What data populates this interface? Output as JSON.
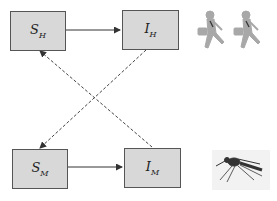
{
  "diagram": {
    "nodes": [
      {
        "id": "SH",
        "label": "S",
        "sub": "H",
        "meaning": "susceptible humans"
      },
      {
        "id": "IH",
        "label": "I",
        "sub": "H",
        "meaning": "infected humans"
      },
      {
        "id": "SM",
        "label": "S",
        "sub": "M",
        "meaning": "susceptible mosquitoes"
      },
      {
        "id": "IM",
        "label": "I",
        "sub": "M",
        "meaning": "infected mosquitoes"
      }
    ],
    "edges": [
      {
        "from": "SH",
        "to": "IH",
        "style": "solid"
      },
      {
        "from": "SM",
        "to": "IM",
        "style": "solid"
      },
      {
        "from": "IH",
        "to": "SM",
        "style": "dashed"
      },
      {
        "from": "IM",
        "to": "SH",
        "style": "dashed"
      }
    ],
    "images": [
      {
        "name": "running-humans",
        "description": "two people running with briefcases"
      },
      {
        "name": "mosquito",
        "description": "mosquito"
      }
    ],
    "colors": {
      "box_fill": "#d8d8d8",
      "box_border": "#555555",
      "line": "#333333",
      "figure": "#a8a8a8"
    }
  }
}
